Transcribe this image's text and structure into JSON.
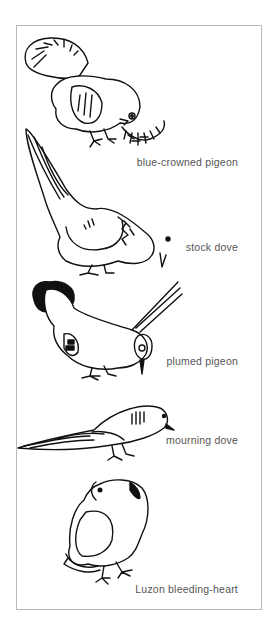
{
  "illustration": {
    "birds": [
      {
        "name": "blue-crowned pigeon"
      },
      {
        "name": "stock dove"
      },
      {
        "name": "plumed pigeon"
      },
      {
        "name": "mourning dove"
      },
      {
        "name": "Luzon bleeding-heart"
      }
    ]
  }
}
